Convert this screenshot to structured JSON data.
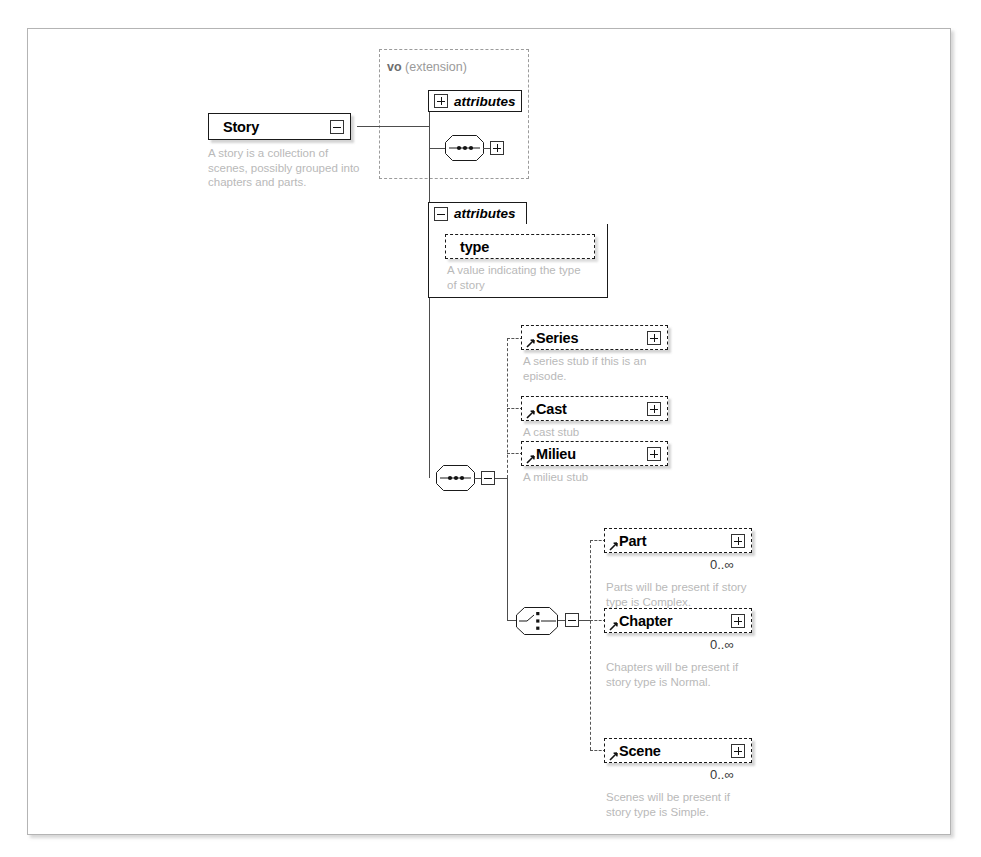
{
  "diagram": {
    "type": "xsd-schema-tree",
    "root": {
      "name": "Story",
      "description": "A story is a collection of\nscenes, possibly grouped into\nchapters and parts.",
      "expander": "minus-icon"
    },
    "extension_group": {
      "label_prefix": "vo",
      "label_suffix": "(extension)",
      "members": [
        {
          "kind": "attributes",
          "label": "attributes",
          "expander": "plus-icon"
        },
        {
          "kind": "sequence",
          "label": "sequence-compositor",
          "expander": "plus-icon"
        }
      ]
    },
    "attributes_block": {
      "label": "attributes",
      "expander": "minus-icon",
      "attributes": [
        {
          "name": "type",
          "optional": true,
          "description": "A value indicating the type\nof story"
        }
      ]
    },
    "sequence": {
      "label": "sequence-compositor",
      "expander": "minus-icon",
      "children": [
        {
          "name": "Series",
          "optional": true,
          "expander": "plus-icon",
          "description": "A series stub if this is an\nepisode.",
          "cardinality": ""
        },
        {
          "name": "Cast",
          "optional": true,
          "expander": "plus-icon",
          "description": "A cast stub",
          "cardinality": ""
        },
        {
          "name": "Milieu",
          "optional": true,
          "expander": "plus-icon",
          "description": "A milieu stub",
          "cardinality": ""
        }
      ]
    },
    "choice": {
      "label": "choice-compositor",
      "expander": "minus-icon",
      "children": [
        {
          "name": "Part",
          "optional": true,
          "expander": "plus-icon",
          "cardinality": "0..∞",
          "description": "Parts will be present if story\ntype is Complex."
        },
        {
          "name": "Chapter",
          "optional": true,
          "expander": "plus-icon",
          "cardinality": "0..∞",
          "description": "Chapters will be present if\nstory type is Normal."
        },
        {
          "name": "Scene",
          "optional": true,
          "expander": "plus-icon",
          "cardinality": "0..∞",
          "description": "Scenes will be present if\nstory type is Simple."
        }
      ]
    },
    "colors": {
      "frame_border": "#b4b4b4",
      "node_border": "#1a1a1a",
      "line": "#4d4d4d",
      "description_text": "#b9b9b9",
      "group_border": "#9b9b9b",
      "background": "#ffffff"
    }
  }
}
